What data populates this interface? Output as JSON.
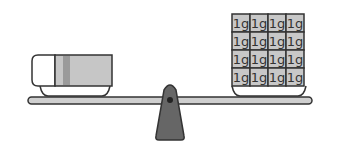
{
  "diagram": {
    "left_pan": {
      "object": "eraser"
    },
    "right_pan": {
      "object": "gram-weights",
      "rows": 4,
      "cols": 4,
      "unit_label": "1g",
      "count": 16
    },
    "colors": {
      "outline": "#333333",
      "beam": "#cfcfcf",
      "fulcrum": "#666666",
      "weight_fill": "#c8c8c8",
      "eraser_sleeve": "#c6c6c6",
      "eraser_stripe": "#9a9a9a",
      "eraser_body": "#ffffff"
    }
  }
}
